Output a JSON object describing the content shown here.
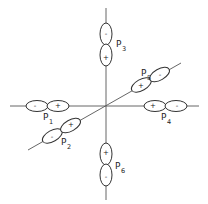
{
  "diagram": {
    "type": "p-orbital arrangement on three axes",
    "center": {
      "x": 106,
      "y": 106
    },
    "orbitals": [
      {
        "id": "p1",
        "label": "P",
        "subscript": "1",
        "axis": "horizontal-left",
        "inner_sign": "+",
        "outer_sign": "-"
      },
      {
        "id": "p2",
        "label": "P",
        "subscript": "2",
        "axis": "diagonal-lower-left",
        "inner_sign": "+",
        "outer_sign": "-"
      },
      {
        "id": "p3",
        "label": "P",
        "subscript": "3",
        "axis": "vertical-top",
        "inner_sign": "+",
        "outer_sign": "-"
      },
      {
        "id": "p4",
        "label": "P",
        "subscript": "4",
        "axis": "horizontal-right",
        "inner_sign": "+",
        "outer_sign": "-"
      },
      {
        "id": "p5",
        "label": "P",
        "subscript": "5",
        "axis": "diagonal-upper-right",
        "inner_sign": "+",
        "outer_sign": "-"
      },
      {
        "id": "p6",
        "label": "P",
        "subscript": "6",
        "axis": "vertical-bottom",
        "inner_sign": "+",
        "outer_sign": "-"
      }
    ]
  }
}
